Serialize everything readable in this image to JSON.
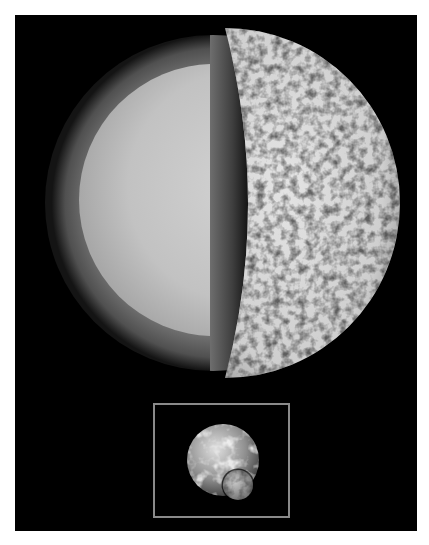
{
  "figure": {
    "title": "Cutaway view of a cratered planetary body with Earth-Moon scale inset",
    "background_color": "#000000",
    "page_color": "#ffffff",
    "main_body": {
      "label": "Cratered planet cutaway",
      "layers": [
        {
          "name": "inner core",
          "color": "#c4c4c4"
        },
        {
          "name": "outer mantle",
          "color": "#7a7a7a"
        },
        {
          "name": "cut-plane shadow",
          "color": "#262626"
        },
        {
          "name": "cratered crust surface",
          "color": "#d0d0d0"
        }
      ]
    },
    "inset": {
      "label": "Earth and Moon to scale",
      "border_color": "#8a8a8a",
      "objects": [
        "Earth",
        "Moon"
      ]
    }
  }
}
